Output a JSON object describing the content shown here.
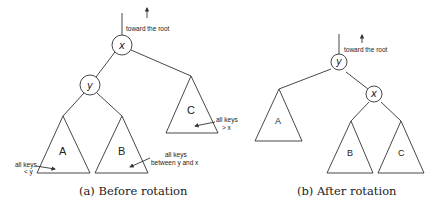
{
  "panel_a": {
    "caption": "(a) Before rotation",
    "root_note": "toward the root",
    "nodes": {
      "x": "x",
      "y": "y"
    },
    "subtrees": {
      "A": "A",
      "B": "B",
      "C": "C"
    },
    "annotations": {
      "a_line1": "all keys",
      "a_line2": "< y",
      "b_line1": "all keys",
      "b_line2": "between y and x",
      "c_line1": "all keys",
      "c_line2": "> x"
    }
  },
  "panel_b": {
    "caption": "(b) After rotation",
    "root_note": "toward the root",
    "nodes": {
      "y": "y",
      "x": "x"
    },
    "subtrees": {
      "A": "A",
      "B": "B",
      "C": "C"
    }
  },
  "colors": {
    "line": "#333333",
    "background": "#ffffff"
  }
}
